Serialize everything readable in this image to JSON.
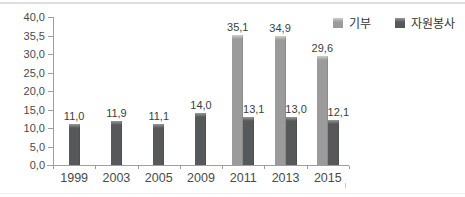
{
  "chart_data": {
    "type": "bar",
    "title": "",
    "xlabel": "",
    "ylabel": "",
    "categories": [
      "1999",
      "2003",
      "2005",
      "2009",
      "2011",
      "2013",
      "2015"
    ],
    "series": [
      {
        "name": "기부",
        "color": "#9b9b9b",
        "color_top": "#cfcfcf",
        "values": [
          null,
          null,
          null,
          null,
          35.1,
          34.9,
          29.6
        ],
        "labels": [
          null,
          null,
          null,
          null,
          "35,1",
          "34,9",
          "29,6"
        ]
      },
      {
        "name": "자원봉사",
        "color": "#57585a",
        "color_top": "#97989a",
        "values": [
          11.0,
          11.9,
          11.1,
          14.0,
          13.1,
          13.0,
          12.1
        ],
        "labels": [
          "11,0",
          "11,9",
          "11,1",
          "14,0",
          "13,1",
          "13,0",
          "12,1"
        ]
      }
    ],
    "ylim": [
      0,
      40
    ],
    "ytick_labels": [
      "40,0",
      "35,5",
      "30,0",
      "25,0",
      "20,0",
      "15,0",
      "10,0",
      "5,0",
      "0,0"
    ],
    "grid": false,
    "legend_position": "top-right",
    "axis_color": "#9e9e9e"
  }
}
